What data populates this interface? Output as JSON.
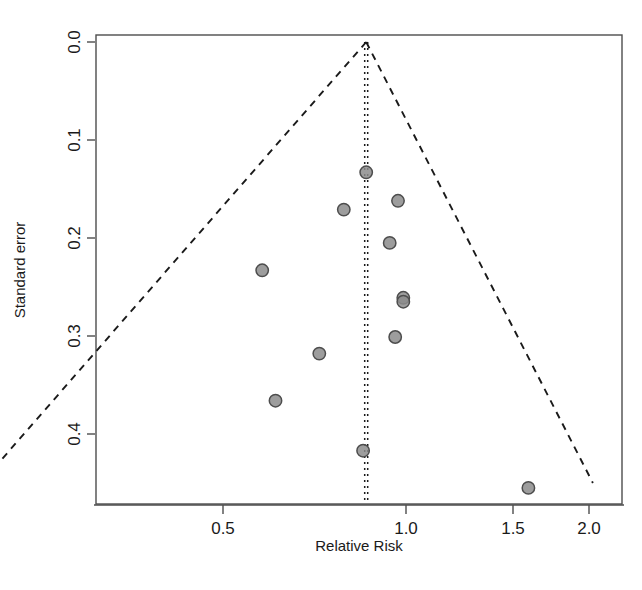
{
  "chart_data": {
    "type": "scatter",
    "title": "",
    "subtitle": "",
    "xlabel": "Relative Risk",
    "ylabel": "Standard error",
    "xscale": "log",
    "yscale": "linear",
    "y_inverted": true,
    "xlim": [
      0.19,
      2.2
    ],
    "ylim": [
      0.0,
      0.455
    ],
    "xticks": [
      0.5,
      1.0,
      1.5,
      2.0
    ],
    "xtick_labels": [
      "0.5",
      "1.0",
      "1.5",
      "2.0"
    ],
    "yticks": [
      0.0,
      0.1,
      0.2,
      0.3,
      0.4
    ],
    "ytick_labels": [
      "0.0",
      "0.1",
      "0.2",
      "0.3",
      "0.4"
    ],
    "grid": false,
    "legend": null,
    "point_color": "#8c8c8c",
    "point_edge_color": "#4d4d4d",
    "line_color": "#1a1a1a",
    "frame_color": "#4d4d4d",
    "series": [
      {
        "name": "studies",
        "x": [
          0.86,
          0.79,
          0.97,
          0.58,
          0.94,
          0.99,
          0.99,
          0.96,
          0.72,
          0.61,
          0.85,
          1.59
        ],
        "y": [
          0.133,
          0.171,
          0.162,
          0.233,
          0.205,
          0.261,
          0.265,
          0.301,
          0.318,
          0.366,
          0.417,
          0.455
        ]
      }
    ],
    "reference_line": {
      "name": "pooled-effect",
      "x": 0.86,
      "style": "dotted"
    },
    "funnel_bounds": {
      "name": "pseudo-95-confidence-limits",
      "apex_x": 0.86,
      "apex_y": 0.0,
      "left_bottom_x": 0.2,
      "right_bottom_x": 2.03,
      "bottom_y": 0.45,
      "style": "dashed"
    }
  },
  "axes": {
    "x_title": "Relative Risk",
    "y_title": "Standard error",
    "x_tick_labels": [
      "0.5",
      "1.0",
      "1.5",
      "2.0"
    ],
    "y_tick_labels": [
      "0.0",
      "0.1",
      "0.2",
      "0.3",
      "0.4"
    ]
  }
}
